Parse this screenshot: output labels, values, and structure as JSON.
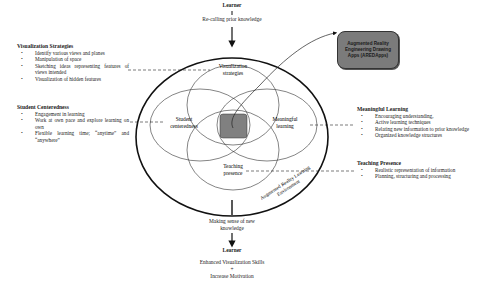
{
  "top": {
    "learner_label": "Learner",
    "recall_label": "Re-calling prior knowledge"
  },
  "bottom": {
    "sense_making_line1": "Making sense of new",
    "sense_making_line2": "knowledge",
    "learner_label": "Learner",
    "outcome1": "Enhanced Visualization Skills",
    "plus": "+",
    "outcome2": "Increase Motivation"
  },
  "circles": {
    "visualization": [
      "Visualization",
      "strategies"
    ],
    "student": [
      "Student",
      "centeredness"
    ],
    "meaningful": [
      "Meaningful",
      "learning"
    ],
    "teaching": [
      "Teaching",
      "presence"
    ],
    "environment": [
      "Augmented Reality Learning",
      "Environment"
    ]
  },
  "ar_app": {
    "line1": "Augmented Reality",
    "line2": "Engineering Drawing",
    "line3": "Apps (AREDApps)",
    "fill_color": "#7b7b7b"
  },
  "center_fill_color": "#808080",
  "panels": {
    "visualization_strategies": {
      "title": "Visualization Strategies",
      "items": [
        "Identify various views and planes",
        "Manipulation of space",
        "Sketching ideas representing features of views intended",
        "Visualization of hidden features"
      ]
    },
    "student_centeredness": {
      "title": "Student Centeredness",
      "items": [
        "Engagement in learning",
        "Work at own pace and explore learning on own",
        "Flexible learning time; “anytime” and “anywhere”"
      ]
    },
    "meaningful_learning": {
      "title": "Meaningful Learning",
      "items": [
        "Encouraging understanding,",
        "Active learning techniques",
        "Relating new information to prior knowledge",
        "Organized knowledge structures"
      ]
    },
    "teaching_presence": {
      "title": "Teaching Presence",
      "items": [
        "Realistic representation of information",
        "Planning, structuring and processing"
      ]
    }
  }
}
